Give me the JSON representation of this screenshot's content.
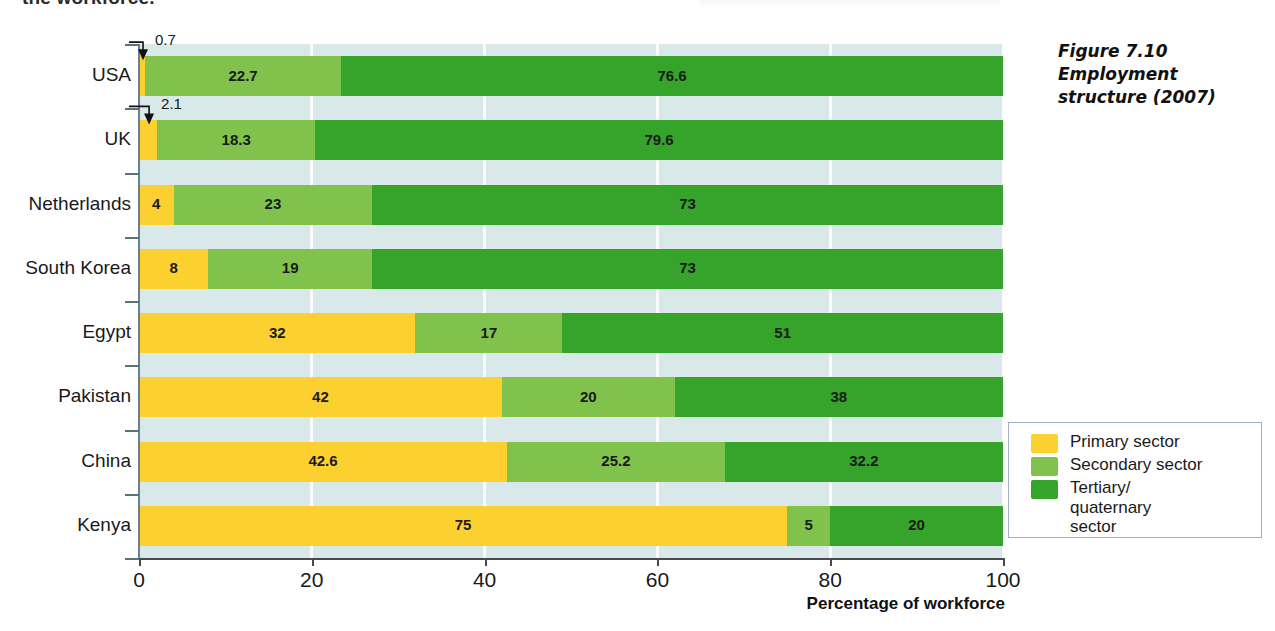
{
  "page": {
    "cutoff_text": "the workforce."
  },
  "caption": {
    "line1": "Figure 7.10",
    "line2": "Employment",
    "line3": "structure (2007)"
  },
  "legend": {
    "items": [
      {
        "label": "Primary sector",
        "color": "#fcd02f"
      },
      {
        "label": "Secondary sector",
        "color": "#80c24c"
      },
      {
        "label": "Tertiary/\nquaternary\nsector",
        "color": "#36a32b"
      }
    ]
  },
  "chart_data": {
    "type": "bar",
    "orientation": "horizontal",
    "stacked": true,
    "percent": true,
    "title": "Employment structure (2007)",
    "xlabel": "Percentage of workforce",
    "ylabel": "",
    "xlim": [
      0,
      100
    ],
    "xticks": [
      0,
      20,
      40,
      60,
      80,
      100
    ],
    "grid": "vertical-white",
    "legend_position": "right",
    "categories": [
      "USA",
      "UK",
      "Netherlands",
      "South Korea",
      "Egypt",
      "Pakistan",
      "China",
      "Kenya"
    ],
    "series": [
      {
        "name": "Primary sector",
        "color": "#fcd02f",
        "values": [
          0.7,
          2.1,
          4,
          8,
          32,
          42,
          42.6,
          75
        ]
      },
      {
        "name": "Secondary sector",
        "color": "#80c24c",
        "values": [
          22.7,
          18.3,
          23,
          19,
          17,
          20,
          25.2,
          5
        ]
      },
      {
        "name": "Tertiary/quaternary sector",
        "color": "#36a32b",
        "values": [
          76.6,
          79.6,
          73,
          73,
          51,
          38,
          32.2,
          20
        ]
      }
    ],
    "value_labels": {
      "USA": [
        "0.7",
        "22.7",
        "76.6"
      ],
      "UK": [
        "2.1",
        "18.3",
        "79.6"
      ],
      "Netherlands": [
        "4",
        "23",
        "73"
      ],
      "South Korea": [
        "8",
        "19",
        "73"
      ],
      "Egypt": [
        "32",
        "17",
        "51"
      ],
      "Pakistan": [
        "42",
        "20",
        "38"
      ],
      "China": [
        "42.6",
        "25.2",
        "32.2"
      ],
      "Kenya": [
        "75",
        "5",
        "20"
      ]
    },
    "annotations": [
      {
        "text": "0.7",
        "category": "USA",
        "series": "Primary sector",
        "style": "leader-arrow"
      },
      {
        "text": "2.1",
        "category": "UK",
        "series": "Primary sector",
        "style": "leader-arrow"
      }
    ],
    "colors": {
      "primary": "#fcd02f",
      "secondary": "#80c24c",
      "tertiary": "#36a32b",
      "plot_background": "#d9e8e8",
      "gridline": "#ffffff",
      "axis": "#4a4a4a"
    }
  }
}
